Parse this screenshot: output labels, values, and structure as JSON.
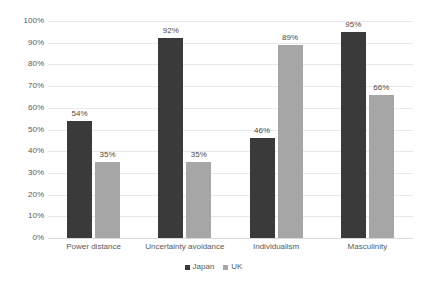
{
  "chart_data": {
    "type": "bar",
    "title": "",
    "subtitle": "",
    "xlabel": "",
    "ylabel": "",
    "ylim": [
      0,
      100
    ],
    "yticks": [
      "0%",
      "10%",
      "20%",
      "30%",
      "40%",
      "50%",
      "60%",
      "70%",
      "80%",
      "90%",
      "100%"
    ],
    "ytick_values": [
      0,
      10,
      20,
      30,
      40,
      50,
      60,
      70,
      80,
      90,
      100
    ],
    "grid": "horizontal",
    "legend_position": "bottom-center",
    "value_suffix": "%",
    "categories": [
      "Power distance",
      "Uncertainty avoidance",
      "Individualism",
      "Masculinity"
    ],
    "series": [
      {
        "name": "Japan",
        "color": "#3a3a3a",
        "values": [
          54,
          92,
          46,
          95
        ],
        "labels": [
          "54%",
          "92%",
          "46%",
          "95%"
        ]
      },
      {
        "name": "UK",
        "color": "#a6a6a6",
        "values": [
          35,
          35,
          89,
          66
        ],
        "labels": [
          "35%",
          "35%",
          "89%",
          "66%"
        ]
      }
    ]
  },
  "colors": {
    "gridline": "#e8e8e8",
    "baseline": "#d9d9d9",
    "tick_text": "#595959",
    "label_text": "#4a4a4a",
    "background": "#ffffff"
  }
}
